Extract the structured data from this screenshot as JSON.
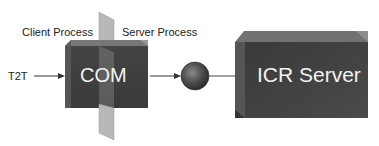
{
  "diagram": {
    "labels": {
      "client_process": "Client Process",
      "server_process": "Server Process",
      "input": "T2T"
    },
    "nodes": {
      "com": {
        "label": "COM"
      },
      "interface": {
        "label": ""
      },
      "icr_server": {
        "label": "ICR Server"
      }
    },
    "edges": [
      {
        "from": "T2T",
        "to": "COM",
        "type": "arrow"
      },
      {
        "from": "COM",
        "to": "interface",
        "type": "arrow"
      },
      {
        "from": "interface",
        "to": "ICR Server",
        "type": "line"
      }
    ],
    "colors": {
      "box_face": "#3c3c3c",
      "box_top": "#6a6a6a",
      "box_side": "#555555",
      "plane": "#b5b5b5",
      "sphere": "#4a4a4a",
      "text_light": "#f2f2f2",
      "text_dark": "#222222"
    }
  }
}
